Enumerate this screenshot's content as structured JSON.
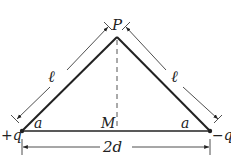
{
  "diagram": {
    "apex_label": "P",
    "left_charge": "+q",
    "right_charge": "−q",
    "midpoint_label": "M",
    "left_side_label": "ℓ",
    "right_side_label": "ℓ",
    "left_angle_label": "a",
    "right_angle_label": "a",
    "base_label": "2d",
    "colors": {
      "line": "#222222",
      "dashed": "#555555"
    }
  }
}
